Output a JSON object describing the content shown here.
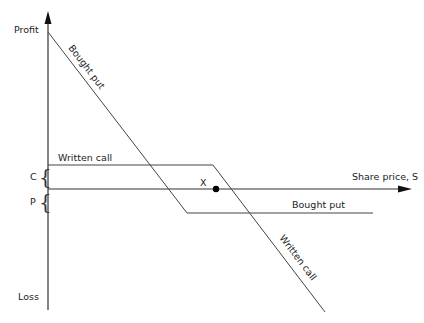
{
  "diagram": {
    "axes": {
      "y_top_label": "Profit",
      "y_bottom_label": "Loss",
      "x_label": "Share price, S"
    },
    "levels": {
      "c_label": "C",
      "p_label": "P",
      "x_label": "X"
    },
    "lines": {
      "bought_put_diagonal_label": "Bought put",
      "bought_put_flat_label": "Bought put",
      "written_call_flat_label": "Written call",
      "written_call_diagonal_label": "Written call"
    },
    "colors": {
      "line": "#444444",
      "axis": "#333333",
      "text": "#222222",
      "background": "#ffffff"
    }
  }
}
